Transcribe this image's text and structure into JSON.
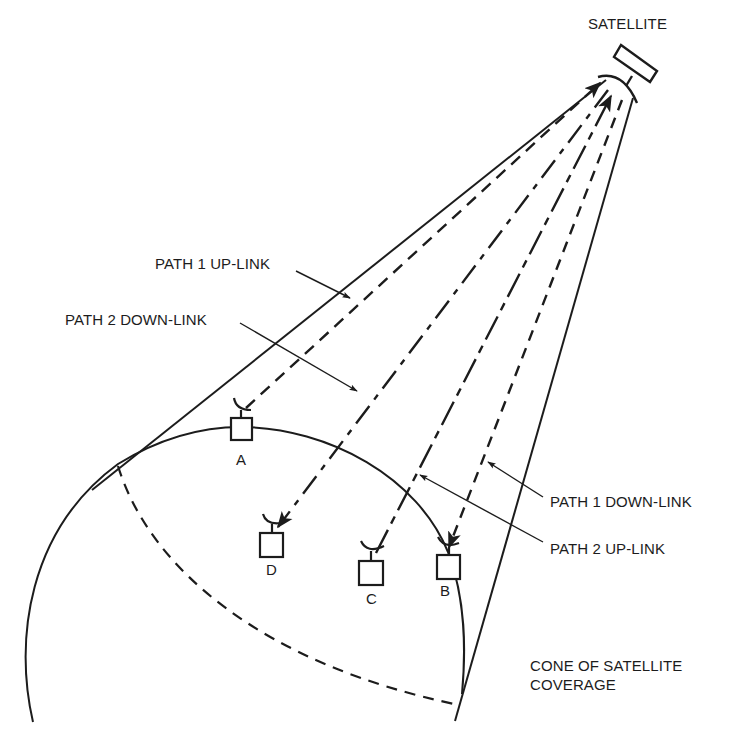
{
  "diagram": {
    "type": "satellite-communication-diagram",
    "ink_color": "#1c1c1c",
    "background": "#ffffff",
    "labels": {
      "satellite": "SATELLITE",
      "path1_uplink": "PATH 1 UP-LINK",
      "path2_downlink": "PATH 2 DOWN-LINK",
      "path1_downlink": "PATH 1 DOWN-LINK",
      "path2_uplink": "PATH 2 UP-LINK",
      "cone_line1": "CONE OF SATELLITE",
      "cone_line2": "COVERAGE"
    },
    "stations": [
      {
        "id": "A",
        "label": "A"
      },
      {
        "id": "B",
        "label": "B"
      },
      {
        "id": "C",
        "label": "C"
      },
      {
        "id": "D",
        "label": "D"
      }
    ],
    "paths": [
      {
        "name": "Path 1 Up-Link",
        "from": "A",
        "to": "Satellite",
        "style": "dashed"
      },
      {
        "name": "Path 1 Down-Link",
        "from": "Satellite",
        "to": "B",
        "style": "short-dashed"
      },
      {
        "name": "Path 2 Up-Link",
        "from": "C",
        "to": "Satellite",
        "style": "long-short-dashed"
      },
      {
        "name": "Path 2 Down-Link",
        "from": "Satellite",
        "to": "D",
        "style": "dash-dot"
      }
    ]
  }
}
